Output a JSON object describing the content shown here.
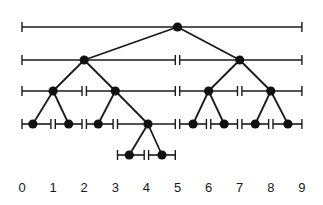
{
  "diagram": {
    "type": "interval-tree",
    "axis": {
      "labels": [
        "0",
        "1",
        "2",
        "3",
        "4",
        "5",
        "6",
        "7",
        "8",
        "9"
      ],
      "x0_px": 22,
      "unit_px": 31.1,
      "label_y": 192
    },
    "colors": {
      "ink": "#1a1a1a",
      "node": "#111111",
      "background": "#ffffff"
    },
    "levels": [
      {
        "y": 27,
        "intervals": [
          {
            "id": "n0",
            "from": 0,
            "to": 9,
            "node": 5
          }
        ]
      },
      {
        "y": 60,
        "intervals": [
          {
            "id": "n1",
            "from": 0,
            "to": 5,
            "node": 2
          },
          {
            "id": "n2",
            "from": 5,
            "to": 9,
            "node": 7
          }
        ]
      },
      {
        "y": 91,
        "intervals": [
          {
            "id": "n3",
            "from": 0,
            "to": 2,
            "node": 1
          },
          {
            "id": "n4",
            "from": 2,
            "to": 5,
            "node": 3
          },
          {
            "id": "n5",
            "from": 5,
            "to": 7,
            "node": 6
          },
          {
            "id": "n6",
            "from": 7,
            "to": 9,
            "node": 8
          }
        ]
      },
      {
        "y": 124,
        "intervals": [
          {
            "id": "n7",
            "from": 0,
            "to": 1,
            "node": 0.35
          },
          {
            "id": "n8",
            "from": 1,
            "to": 2,
            "node": 1.5
          },
          {
            "id": "n9",
            "from": 2,
            "to": 3,
            "node": 2.45
          },
          {
            "id": "n10",
            "from": 3,
            "to": 5,
            "node": 4.05
          },
          {
            "id": "n11",
            "from": 5,
            "to": 6,
            "node": 5.5
          },
          {
            "id": "n12",
            "from": 6,
            "to": 7,
            "node": 6.5
          },
          {
            "id": "n13",
            "from": 7,
            "to": 8,
            "node": 7.5
          },
          {
            "id": "n14",
            "from": 8,
            "to": 9,
            "node": 8.55
          }
        ]
      },
      {
        "y": 155,
        "intervals": [
          {
            "id": "n15",
            "from": 3,
            "to": 4,
            "node": 3.45
          },
          {
            "id": "n16",
            "from": 4,
            "to": 5,
            "node": 4.5
          }
        ]
      }
    ],
    "edges": [
      [
        "n0",
        "n1"
      ],
      [
        "n0",
        "n2"
      ],
      [
        "n1",
        "n3"
      ],
      [
        "n1",
        "n4"
      ],
      [
        "n2",
        "n5"
      ],
      [
        "n2",
        "n6"
      ],
      [
        "n3",
        "n7"
      ],
      [
        "n3",
        "n8"
      ],
      [
        "n4",
        "n9"
      ],
      [
        "n4",
        "n10"
      ],
      [
        "n5",
        "n11"
      ],
      [
        "n5",
        "n12"
      ],
      [
        "n6",
        "n13"
      ],
      [
        "n6",
        "n14"
      ],
      [
        "n10",
        "n15"
      ],
      [
        "n10",
        "n16"
      ]
    ]
  }
}
